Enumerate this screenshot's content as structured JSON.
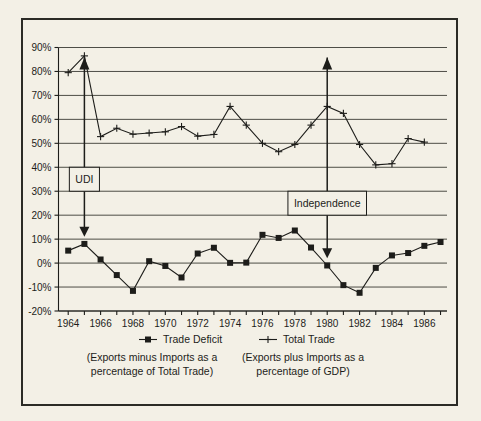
{
  "chart_data": {
    "type": "line",
    "title": "",
    "xlabel": "",
    "ylabel": "",
    "x": [
      1964,
      1965,
      1966,
      1967,
      1968,
      1969,
      1970,
      1971,
      1972,
      1973,
      1974,
      1975,
      1976,
      1977,
      1978,
      1979,
      1980,
      1981,
      1982,
      1983,
      1984,
      1985,
      1986,
      1987
    ],
    "xlim": [
      1963.4,
      1987.4
    ],
    "ylim": [
      -20,
      90
    ],
    "ytick_step": 10,
    "ytick_labels": [
      "90%",
      "80%",
      "70%",
      "60%",
      "50%",
      "40%",
      "30%",
      "20%",
      "10%",
      "0%",
      "-10%",
      "-20%"
    ],
    "ytick_values": [
      90,
      80,
      70,
      60,
      50,
      40,
      30,
      20,
      10,
      0,
      -10,
      -20
    ],
    "xtick_labels": [
      "1964",
      "1966",
      "1968",
      "1970",
      "1972",
      "1974",
      "1976",
      "1978",
      "1980",
      "1982",
      "1984",
      "1986"
    ],
    "xtick_values": [
      1964,
      1966,
      1968,
      1970,
      1972,
      1974,
      1976,
      1978,
      1980,
      1982,
      1984,
      1986
    ],
    "grid": true,
    "legend_position": "bottom",
    "series": [
      {
        "name": "Trade Deficit",
        "marker": "filled-square",
        "x": [
          1964,
          1965,
          1966,
          1967,
          1968,
          1969,
          1970,
          1971,
          1972,
          1973,
          1974,
          1975,
          1976,
          1977,
          1978,
          1979,
          1980,
          1981,
          1982,
          1983,
          1984,
          1985,
          1986,
          1987
        ],
        "values": [
          5.2,
          8.0,
          1.5,
          -5.0,
          -11.6,
          0.8,
          -1.2,
          -6.0,
          4.0,
          6.4,
          0.1,
          0.2,
          11.8,
          10.5,
          13.6,
          6.5,
          -1.0,
          -9.2,
          -12.4,
          -2.0,
          3.2,
          4.2,
          7.2,
          8.8
        ]
      },
      {
        "name": "Total Trade",
        "marker": "plus",
        "x": [
          1964,
          1965,
          1966,
          1967,
          1968,
          1969,
          1970,
          1971,
          1972,
          1973,
          1974,
          1975,
          1976,
          1977,
          1978,
          1979,
          1980,
          1981,
          1982,
          1983,
          1984,
          1985,
          1986
        ],
        "values": [
          79.5,
          86.5,
          52.8,
          56.3,
          53.8,
          54.3,
          54.8,
          57.0,
          53.0,
          53.7,
          65.4,
          57.6,
          50.0,
          46.5,
          49.5,
          57.6,
          65.4,
          62.5,
          49.5,
          41.0,
          41.5,
          52.0,
          50.5
        ]
      }
    ],
    "annotations": [
      {
        "label": "UDI",
        "x": 1965,
        "box_top_pct": 40,
        "box_bottom_pct": 30,
        "arrow_to_pct": 11
      },
      {
        "label": "Independence",
        "x": 1980,
        "box_top_pct": 30,
        "box_bottom_pct": 20,
        "arrow_to_pct": 2
      }
    ],
    "captions": [
      {
        "line1": "(Exports minus Imports as a",
        "line2": "percentage of Total Trade)"
      },
      {
        "line1": "(Exports plus Imports as a",
        "line2": "percentage of GDP)"
      }
    ]
  },
  "colors": {
    "background": "#f3f0e6",
    "ink": "#1d1d1a",
    "grid": "#3a3a33"
  }
}
